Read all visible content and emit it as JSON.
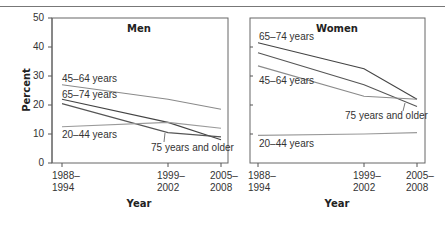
{
  "chart_data": [
    {
      "type": "line",
      "title": "Men",
      "xlabel": "Year",
      "ylabel": "Percent",
      "ylim": [
        0,
        50
      ],
      "yticks": [
        0,
        10,
        20,
        30,
        40,
        50
      ],
      "categories": [
        "1988–1994",
        "1999–2002",
        "2005–2008"
      ],
      "grid": false,
      "series": [
        {
          "name": "45–64 years",
          "values": [
            27,
            22,
            18.5
          ],
          "color": "#8a8a8a"
        },
        {
          "name": "65–74 years",
          "values": [
            22,
            14,
            8
          ],
          "color": "#444444"
        },
        {
          "name": "75 years and older",
          "values": [
            20.5,
            10.5,
            9
          ],
          "color": "#555555"
        },
        {
          "name": "20–44 years",
          "values": [
            12.5,
            14,
            12
          ],
          "color": "#9a9a9a"
        }
      ]
    },
    {
      "type": "line",
      "title": "Women",
      "xlabel": "Year",
      "ylabel": "Percent",
      "ylim": [
        0,
        50
      ],
      "yticks": [
        0,
        10,
        20,
        30,
        40,
        50
      ],
      "categories": [
        "1988–1994",
        "1999–2002",
        "2005–2008"
      ],
      "grid": false,
      "series": [
        {
          "name": "65–74 years",
          "values": [
            41.5,
            32.5,
            22
          ],
          "color": "#444444"
        },
        {
          "name": "75 years and older",
          "values": [
            38,
            27,
            19.5
          ],
          "color": "#555555"
        },
        {
          "name": "45–64 years",
          "values": [
            33.5,
            23,
            22
          ],
          "color": "#8a8a8a"
        },
        {
          "name": "20–44 years",
          "values": [
            9.5,
            10,
            10.5
          ],
          "color": "#9a9a9a"
        }
      ]
    }
  ],
  "labels": {
    "y_axis_title": "Percent",
    "x_axis_title": "Year",
    "yticks": [
      "0",
      "10",
      "20",
      "30",
      "40",
      "50"
    ],
    "xticks_line1": [
      "1988–",
      "1999–",
      "2005–"
    ],
    "xticks_line2": [
      "1994",
      "2002",
      "2008"
    ],
    "men_title": "Men",
    "women_title": "Women",
    "men_series_labels": [
      "45–64 years",
      "65–74 years",
      "20–44 years",
      "75 years and older"
    ],
    "women_series_labels": [
      "65–74 years",
      "45–64 years",
      "75 years and older",
      "20–44 years"
    ]
  }
}
